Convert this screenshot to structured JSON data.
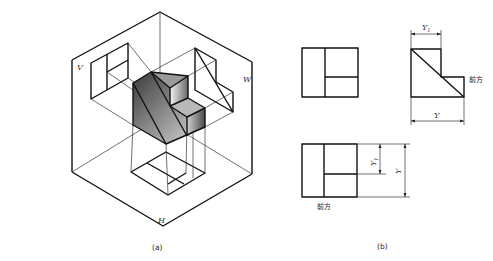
{
  "figure_a": {
    "caption": "(a)",
    "plane_labels": {
      "v": "V",
      "w": "W",
      "h": "H"
    }
  },
  "figure_b": {
    "caption": "(b)",
    "side_view": {
      "dim_y1": "Y",
      "dim_y1_sub": "1",
      "dim_y": "Y",
      "front_label": "前方"
    },
    "top_view": {
      "dim_y1": "Y",
      "dim_y1_sub": "1",
      "dim_y": "Y",
      "front_label": "前方"
    }
  },
  "colors": {
    "line": "#111111",
    "thin_line": "#333333",
    "background": "#ffffff"
  }
}
